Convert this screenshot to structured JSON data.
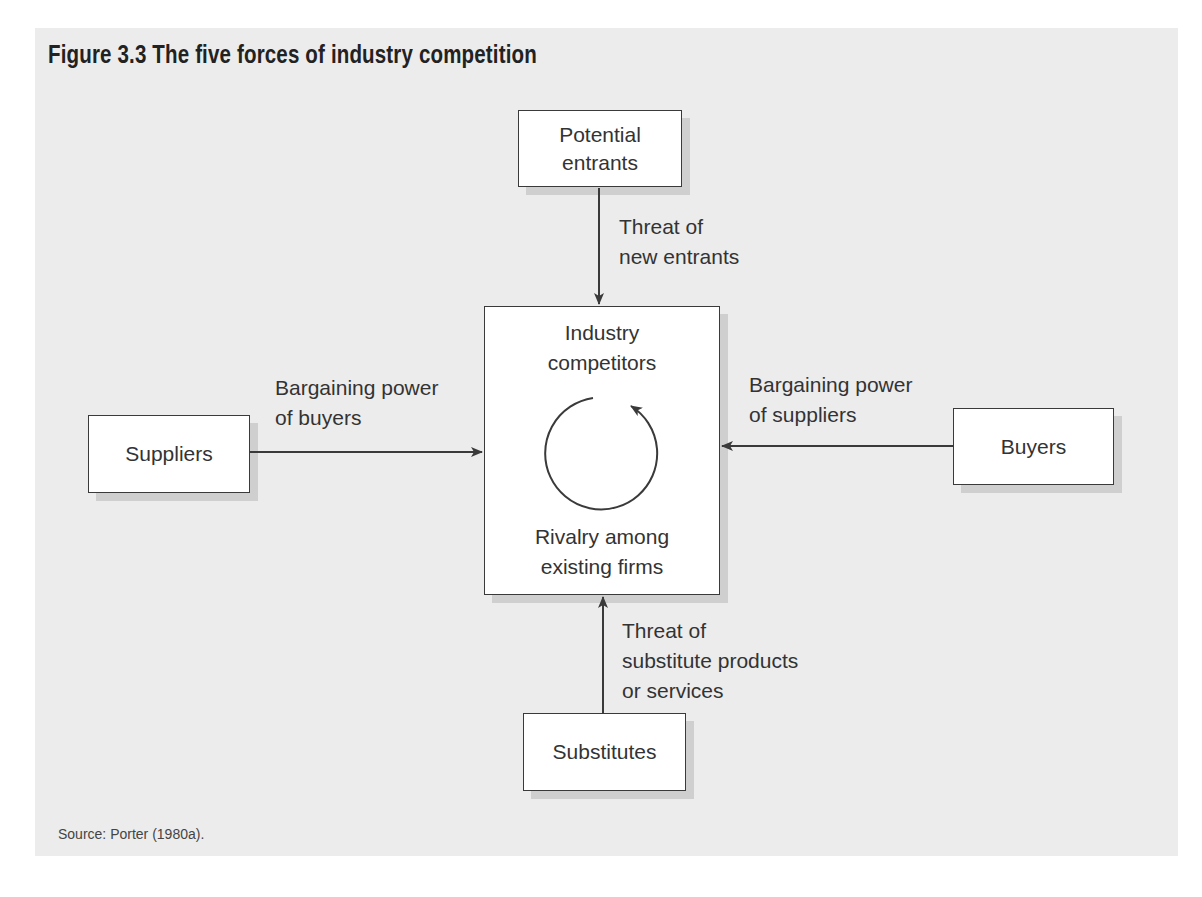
{
  "figure": {
    "title": "Figure 3.3  The five forces of industry competition",
    "source": "Source: Porter (1980a)."
  },
  "nodes": {
    "potential_entrants": {
      "line1": "Potential",
      "line2": "entrants"
    },
    "industry_competitors": {
      "line1": "Industry",
      "line2": "competitors"
    },
    "rivalry": {
      "line1": "Rivalry among",
      "line2": "existing firms"
    },
    "suppliers": {
      "label": "Suppliers"
    },
    "buyers": {
      "label": "Buyers"
    },
    "substitutes": {
      "label": "Substitutes"
    }
  },
  "edges": {
    "new_entrants": {
      "line1": "Threat of",
      "line2": "new entrants"
    },
    "power_left": {
      "line1": "Bargaining power",
      "line2": "of buyers"
    },
    "power_right": {
      "line1": "Bargaining power",
      "line2": "of suppliers"
    },
    "substitutes": {
      "line1": "Threat of",
      "line2": "substitute products",
      "line3": "or services"
    }
  },
  "colors": {
    "panel": "#ececec",
    "stroke": "#3a3a3a",
    "shadow": "#cfcfcf",
    "text": "#333333"
  }
}
